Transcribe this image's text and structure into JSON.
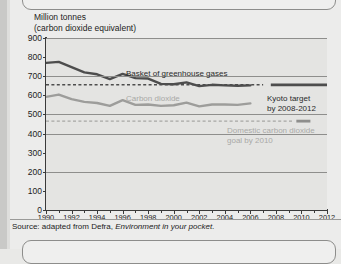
{
  "page": {
    "background_color": "#ececeb",
    "gutter_color": "#c9c9c7"
  },
  "chart_title_line1": "Million tonnes",
  "chart_title_line2": "(carbon dioxide equivalent)",
  "source": {
    "prefix": "Source: adapted from Defra, ",
    "italic": "Environment in your pocket",
    "suffix": "."
  },
  "annotations": {
    "basket_label": "Basket of greenhouse gases",
    "carbon_dioxide_label": "Carbon dioxide",
    "kyoto_line1": "Kyoto target",
    "kyoto_line2": "by 2008-2012",
    "domestic_line1": "Domestic carbon dioxide",
    "domestic_line2": "goal by 2010"
  },
  "chart_data": {
    "type": "line",
    "xlabel": "",
    "ylabel": "Million tonnes (carbon dioxide equivalent)",
    "xlim": [
      1990,
      2012
    ],
    "ylim": [
      0,
      900
    ],
    "ytick_step": 100,
    "yticks": [
      0,
      100,
      200,
      300,
      400,
      500,
      600,
      700,
      800,
      900
    ],
    "ytick_labels": [
      "0",
      "100",
      "200",
      "300",
      "400",
      "500",
      "600",
      "700",
      "800",
      "900"
    ],
    "gridlines": [
      200,
      400,
      500,
      700,
      900
    ],
    "grid": true,
    "xticks": [
      1990,
      1992,
      1994,
      1996,
      1998,
      2000,
      2002,
      2004,
      2006,
      2008,
      2010,
      2012
    ],
    "xtick_labels": [
      "1990",
      "1992",
      "1994",
      "1996",
      "1998",
      "2000",
      "2002",
      "2004",
      "2006",
      "2008",
      "2010",
      "2012"
    ],
    "xminor_step": 1,
    "legend": "inline-labels",
    "series": [
      {
        "name": "Basket of greenhouse gases",
        "color": "#4d4d4d",
        "width": 2.4,
        "x": [
          1990,
          1991,
          1992,
          1993,
          1994,
          1995,
          1996,
          1997,
          1998,
          1999,
          2000,
          2001,
          2002,
          2003,
          2004,
          2005,
          2006
        ],
        "values": [
          770,
          775,
          748,
          720,
          710,
          685,
          712,
          690,
          688,
          660,
          658,
          668,
          648,
          655,
          652,
          650,
          652
        ]
      },
      {
        "name": "Carbon dioxide",
        "color": "#9d9d9b",
        "width": 2.4,
        "x": [
          1990,
          1991,
          1992,
          1993,
          1994,
          1995,
          1996,
          1997,
          1998,
          1999,
          2000,
          2001,
          2002,
          2003,
          2004,
          2005,
          2006
        ],
        "values": [
          592,
          604,
          580,
          566,
          560,
          545,
          575,
          550,
          552,
          545,
          548,
          562,
          542,
          552,
          552,
          550,
          558
        ]
      }
    ],
    "reference_lines": [
      {
        "name": "Kyoto target by 2008-2012",
        "value": 655,
        "style": "dashed",
        "color": "#4d4d4d",
        "x_start": 1990,
        "x_end": 2007,
        "solid_segment": {
          "x_start": 2007.6,
          "x_end": 2012,
          "color": "#4d4d4d"
        }
      },
      {
        "name": "Domestic carbon dioxide goal by 2010",
        "value": 465,
        "style": "dashed",
        "color": "#a6a6a4",
        "x_start": 1990,
        "x_end": 2009.4,
        "solid_segment": {
          "x_start": 2009.6,
          "x_end": 2010.7,
          "color": "#8e8e8c"
        }
      }
    ]
  }
}
